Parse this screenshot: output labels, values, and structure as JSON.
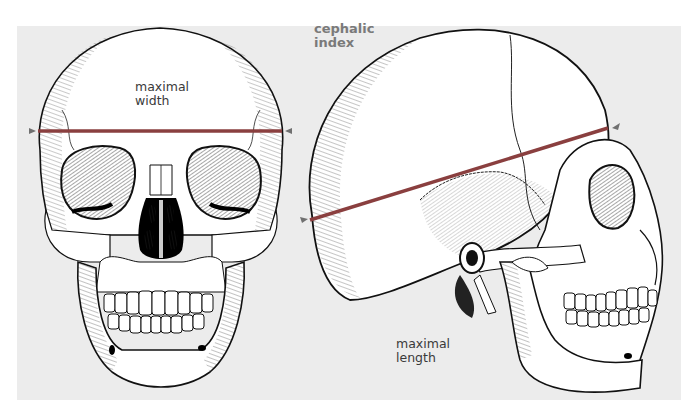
{
  "figure": {
    "title_line1": "cephalic",
    "title_line2": "index",
    "frontal_view": {
      "label_line1": "maximal",
      "label_line2": "width",
      "measure": "maximal width"
    },
    "lateral_view": {
      "label_line1": "maximal",
      "label_line2": "length",
      "measure": "maximal length"
    }
  },
  "colors": {
    "panel_bg": "#ececec",
    "measure_line": "#8a3f3f",
    "marker": "#707070",
    "ink": "#111111",
    "bone": "#ffffff",
    "title_text": "#7a7a7a",
    "label_text": "#3a3a3a"
  }
}
